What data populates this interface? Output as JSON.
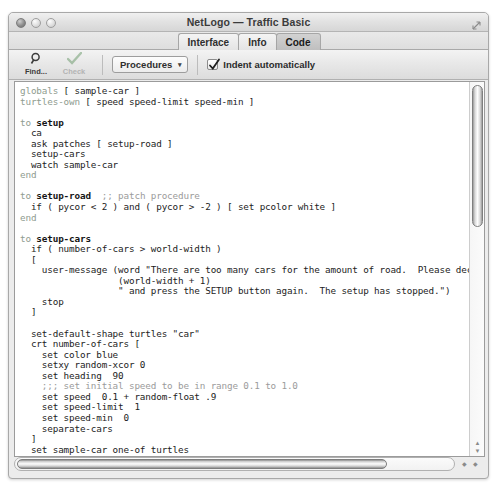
{
  "window": {
    "title": "NetLogo — Traffic Basic",
    "lights": [
      "close",
      "minimize",
      "zoom"
    ],
    "resize_icon": "resize-corner-icon"
  },
  "tabs": [
    {
      "label": "Interface",
      "active": false
    },
    {
      "label": "Info",
      "active": false
    },
    {
      "label": "Code",
      "active": true
    }
  ],
  "toolbar": {
    "find": {
      "label": "Find...",
      "icon": "magnifier-icon",
      "enabled": true
    },
    "check": {
      "label": "Check",
      "icon": "checkmark-icon",
      "enabled": false
    },
    "procedures": {
      "label": "Procedures",
      "caret": "▾",
      "icon": "chevron-down-icon"
    },
    "indent": {
      "label": "Indent automatically",
      "checked": true,
      "icon": "checkbox-checked-icon"
    }
  },
  "editor": {
    "code": "globals [ sample-car ]\nturtles-own [ speed speed-limit speed-min ]\n\nto setup\n  ca\n  ask patches [ setup-road ]\n  setup-cars\n  watch sample-car\nend\n\nto setup-road  ;; patch procedure\n  if ( pycor < 2 ) and ( pycor > -2 ) [ set pcolor white ]\nend\n\nto setup-cars\n  if ( number-of-cars > world-width )\n  [\n    user-message (word \"There are too many cars for the amount of road.  Please decrease the NUMBER-O\n                  (world-width + 1)\n                  \" and press the SETUP button again.  The setup has stopped.\")\n    stop\n  ]\n\n  set-default-shape turtles \"car\"\n  crt number-of-cars [\n    set color blue\n    setxy random-xcor 0\n    set heading  90\n    ;;; set initial speed to be in range 0.1 to 1.0\n    set speed  0.1 + random-float .9\n    set speed-limit  1\n    set speed-min  0\n    separate-cars\n  ]\n  set sample-car one-of turtles\n  ask sample-car [ set color red ]\nend",
    "vertical_scrollbar": {
      "name": "vertical-scrollbar",
      "thumb_top_pct": 1,
      "thumb_height_pct": 38
    },
    "horizontal_scrollbar": {
      "name": "horizontal-scrollbar",
      "thumb_left_pct": 0,
      "thumb_width_pct": 84
    },
    "scroll_up_glyph": "▲",
    "scroll_down_glyph": "▼",
    "scroll_left_glyph": "◆",
    "scroll_right_glyph": "◆"
  }
}
